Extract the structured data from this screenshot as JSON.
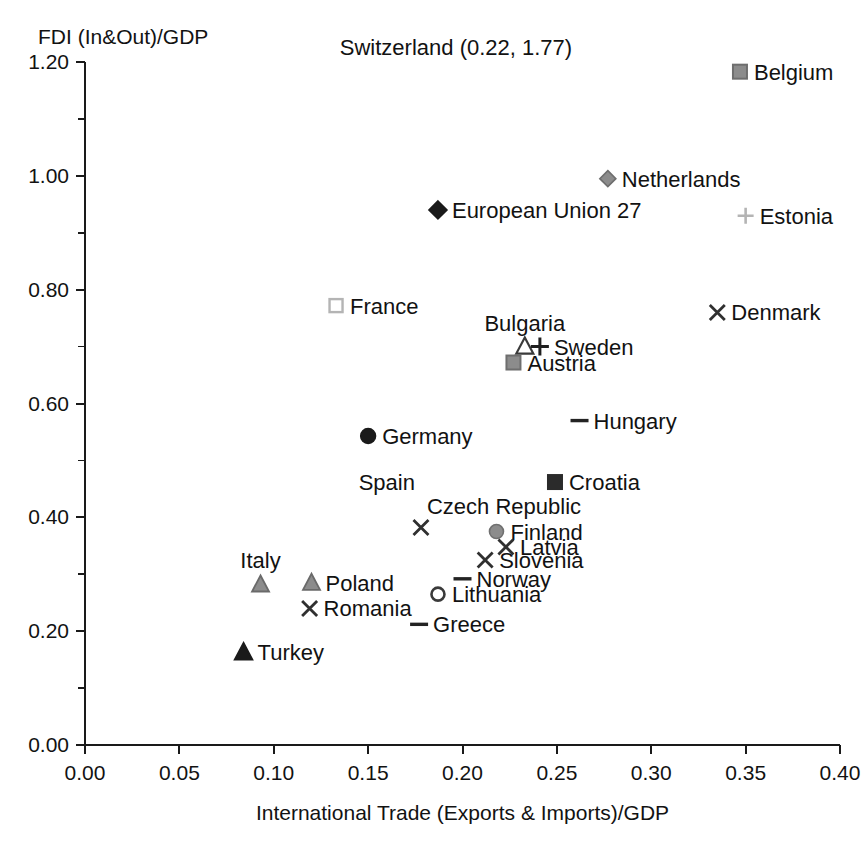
{
  "chart_data": {
    "type": "scatter",
    "title": "",
    "xlabel": "International Trade (Exports & Imports)/GDP",
    "ylabel": "FDI (In&Out)/GDP",
    "xlim": [
      0.0,
      0.4
    ],
    "ylim": [
      0.0,
      1.2
    ],
    "xticks": [
      "0.00",
      "0.05",
      "0.10",
      "0.15",
      "0.20",
      "0.25",
      "0.30",
      "0.35",
      "0.40"
    ],
    "xtick_values": [
      0.0,
      0.05,
      0.1,
      0.15,
      0.2,
      0.25,
      0.3,
      0.35,
      0.4
    ],
    "yticks": [
      "0.00",
      "0.20",
      "0.40",
      "0.60",
      "0.80",
      "1.00",
      "1.20"
    ],
    "ytick_values": [
      0.0,
      0.2,
      0.4,
      0.6,
      0.8,
      1.0,
      1.2
    ],
    "y_minor_values": [
      0.1,
      0.3,
      0.5,
      0.7,
      0.9,
      1.1
    ],
    "grid": false,
    "legend": "none",
    "annotations": [
      {
        "text": "Switzerland (0.22, 1.77)",
        "x": 0.135,
        "y": 1.205,
        "note": "off-chart point listed as text near top"
      }
    ],
    "points": [
      {
        "name": "Belgium",
        "x": 0.347,
        "y": 1.183,
        "marker": "square-filled-gray",
        "label_side": "right"
      },
      {
        "name": "Netherlands",
        "x": 0.277,
        "y": 0.995,
        "marker": "diamond-filled-gray",
        "label_side": "right"
      },
      {
        "name": "European Union 27",
        "x": 0.187,
        "y": 0.94,
        "marker": "diamond-filled-black",
        "label_side": "right"
      },
      {
        "name": "Estonia",
        "x": 0.35,
        "y": 0.93,
        "marker": "plus-gray",
        "label_side": "right"
      },
      {
        "name": "France",
        "x": 0.133,
        "y": 0.772,
        "marker": "square-hollow-gray",
        "label_side": "right"
      },
      {
        "name": "Denmark",
        "x": 0.335,
        "y": 0.76,
        "marker": "x-dark",
        "label_side": "right"
      },
      {
        "name": "Bulgaria",
        "x": 0.233,
        "y": 0.7,
        "marker": "triangle-hollow",
        "label_side": "above"
      },
      {
        "name": "Sweden",
        "x": 0.241,
        "y": 0.7,
        "marker": "plus-dark",
        "label_side": "right"
      },
      {
        "name": "Austria",
        "x": 0.227,
        "y": 0.672,
        "marker": "square-filled-gray",
        "label_side": "right"
      },
      {
        "name": "Hungary",
        "x": 0.262,
        "y": 0.57,
        "marker": "dash-dark",
        "label_side": "right"
      },
      {
        "name": "Germany",
        "x": 0.15,
        "y": 0.543,
        "marker": "circle-filled-black",
        "label_side": "right"
      },
      {
        "name": "Croatia",
        "x": 0.249,
        "y": 0.462,
        "marker": "square-filled-dark",
        "label_side": "right"
      },
      {
        "name": "Spain",
        "x": 0.178,
        "y": 0.382,
        "marker": "none",
        "label_side": "above-left"
      },
      {
        "name": "Czech Republic",
        "x": 0.178,
        "y": 0.382,
        "marker": "x-dark",
        "label_side": "above-right"
      },
      {
        "name": "Finland",
        "x": 0.218,
        "y": 0.375,
        "marker": "circle-filled-gray",
        "label_side": "right"
      },
      {
        "name": "Latvia",
        "x": 0.223,
        "y": 0.348,
        "marker": "x-dark",
        "label_side": "right"
      },
      {
        "name": "Slovenia",
        "x": 0.212,
        "y": 0.325,
        "marker": "x-dark",
        "label_side": "right"
      },
      {
        "name": "Norway",
        "x": 0.2,
        "y": 0.292,
        "marker": "dash-dark",
        "label_side": "right"
      },
      {
        "name": "Italy",
        "x": 0.093,
        "y": 0.282,
        "marker": "triangle-filled-gray",
        "label_side": "above"
      },
      {
        "name": "Poland",
        "x": 0.12,
        "y": 0.285,
        "marker": "triangle-filled-gray",
        "label_side": "right"
      },
      {
        "name": "Lithuania",
        "x": 0.187,
        "y": 0.265,
        "marker": "circle-hollow-dark",
        "label_side": "right"
      },
      {
        "name": "Romania",
        "x": 0.119,
        "y": 0.24,
        "marker": "x-dark",
        "label_side": "right"
      },
      {
        "name": "Greece",
        "x": 0.177,
        "y": 0.212,
        "marker": "dash-dark",
        "label_side": "right"
      },
      {
        "name": "Turkey",
        "x": 0.084,
        "y": 0.163,
        "marker": "triangle-filled-black",
        "label_side": "right"
      }
    ],
    "colors": {
      "axis": "#1a1a1a",
      "text": "#121212",
      "marker_black": "#1a1a1a",
      "marker_dark": "#3a3a3a",
      "marker_gray": "#8c8c8c",
      "marker_light_gray": "#b4b4b4",
      "background": "#ffffff"
    }
  }
}
